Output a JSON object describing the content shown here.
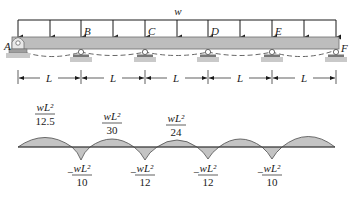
{
  "beam": {
    "load_label": "w",
    "support_labels": [
      "A",
      "B",
      "C",
      "D",
      "E",
      "F"
    ],
    "span_label": "L",
    "span_count": 5,
    "colors": {
      "beam_fill": "#bdbdbd",
      "beam_stroke": "#6e6e6e",
      "load": "#1a1a1a",
      "support_fill": "#9e9e9e",
      "deflection": "#555555"
    }
  },
  "moment_diagram": {
    "positive_moments": [
      {
        "num": "wL²",
        "den": "12.5"
      },
      {
        "num": "wL²",
        "den": "30"
      },
      {
        "num": "wL²",
        "den": "24"
      }
    ],
    "negative_moments": [
      {
        "sign": "−",
        "num": "wL²",
        "den": "10"
      },
      {
        "sign": "−",
        "num": "wL²",
        "den": "12"
      },
      {
        "sign": "−",
        "num": "wL²",
        "den": "12"
      },
      {
        "sign": "−",
        "num": "wL²",
        "den": "10"
      }
    ],
    "colors": {
      "fill": "#c4c4c4",
      "stroke": "#4a4a4a",
      "baseline": "#3a3a3a"
    }
  }
}
